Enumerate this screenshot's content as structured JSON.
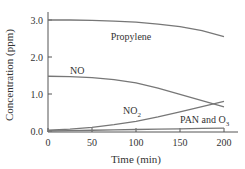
{
  "chart_data": {
    "type": "line",
    "title": "",
    "xlabel": "Time (min)",
    "ylabel": "Concentration (ppm)",
    "xlim": [
      0,
      200
    ],
    "ylim": [
      0,
      3.0
    ],
    "x_ticks": [
      "0",
      "50",
      "100",
      "150",
      "200"
    ],
    "y_ticks": [
      "0.0",
      "1.0",
      "2.0",
      "3.0"
    ],
    "grid": false,
    "legend": "inline labels",
    "x": [
      0,
      25,
      50,
      75,
      100,
      125,
      150,
      175,
      200
    ],
    "series": [
      {
        "name": "Propylene",
        "label": "Propylene",
        "values": [
          3.0,
          3.0,
          2.99,
          2.97,
          2.94,
          2.89,
          2.82,
          2.71,
          2.55
        ]
      },
      {
        "name": "NO",
        "label": "NO",
        "values": [
          1.48,
          1.47,
          1.44,
          1.39,
          1.3,
          1.16,
          0.99,
          0.82,
          0.65
        ]
      },
      {
        "name": "NO2",
        "label": "NO",
        "label_sub": "2",
        "values": [
          0.02,
          0.05,
          0.1,
          0.17,
          0.26,
          0.38,
          0.52,
          0.66,
          0.8
        ]
      },
      {
        "name": "PAN and O3",
        "label": "PAN and O",
        "label_sub": "3",
        "values": [
          0.0,
          0.01,
          0.02,
          0.03,
          0.04,
          0.05,
          0.06,
          0.07,
          0.08
        ]
      }
    ]
  }
}
